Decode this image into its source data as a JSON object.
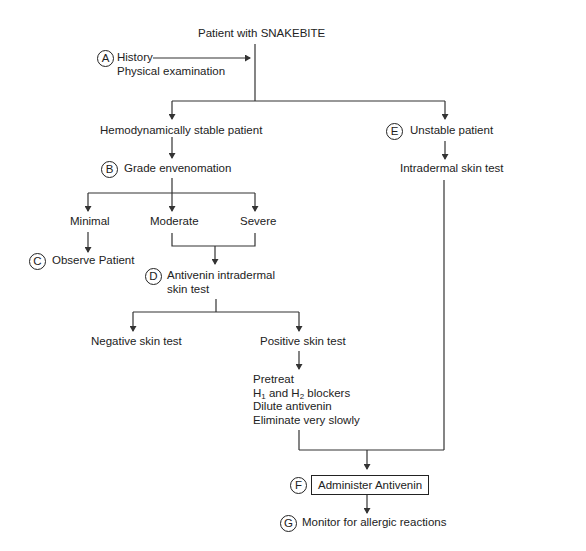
{
  "diagram": {
    "type": "flowchart",
    "title": "Patient with SNAKEBITE",
    "nodes": {
      "root": "Patient with SNAKEBITE",
      "a_label": "A",
      "a_line1": "History",
      "a_line2": "Physical examination",
      "stable": "Hemodynamically stable patient",
      "b_label": "B",
      "grade": "Grade envenomation",
      "minimal": "Minimal",
      "moderate": "Moderate",
      "severe": "Severe",
      "c_label": "C",
      "observe": "Observe Patient",
      "d_label": "D",
      "antivenin_line1": "Antivenin intradermal",
      "antivenin_line2": "skin test",
      "negative": "Negative skin test",
      "positive": "Positive skin test",
      "pretreat_line1": "Pretreat",
      "pretreat_h1": "H",
      "pretreat_h1_sub": "1",
      "pretreat_and": " and H",
      "pretreat_h2_sub": "2",
      "pretreat_blockers": " blockers",
      "pretreat_line3": "Dilute antivenin",
      "pretreat_line4": "Eliminate very slowly",
      "e_label": "E",
      "unstable": "Unstable patient",
      "intradermal": "Intradermal skin test",
      "f_label": "F",
      "administer": "Administer Antivenin",
      "g_label": "G",
      "monitor": "Monitor for allergic reactions"
    },
    "edges": [
      [
        "a_history",
        "root"
      ],
      [
        "root",
        "stable"
      ],
      [
        "root",
        "unstable"
      ],
      [
        "stable",
        "grade"
      ],
      [
        "grade",
        "minimal"
      ],
      [
        "grade",
        "moderate"
      ],
      [
        "grade",
        "severe"
      ],
      [
        "minimal",
        "observe"
      ],
      [
        "moderate+severe",
        "antivenin"
      ],
      [
        "antivenin",
        "negative"
      ],
      [
        "antivenin",
        "positive"
      ],
      [
        "positive",
        "pretreat"
      ],
      [
        "unstable",
        "intradermal"
      ],
      [
        "pretreat+intradermal",
        "administer"
      ],
      [
        "administer",
        "monitor"
      ]
    ],
    "colors": {
      "line": "#333333",
      "text": "#222222",
      "background": "#ffffff"
    }
  }
}
